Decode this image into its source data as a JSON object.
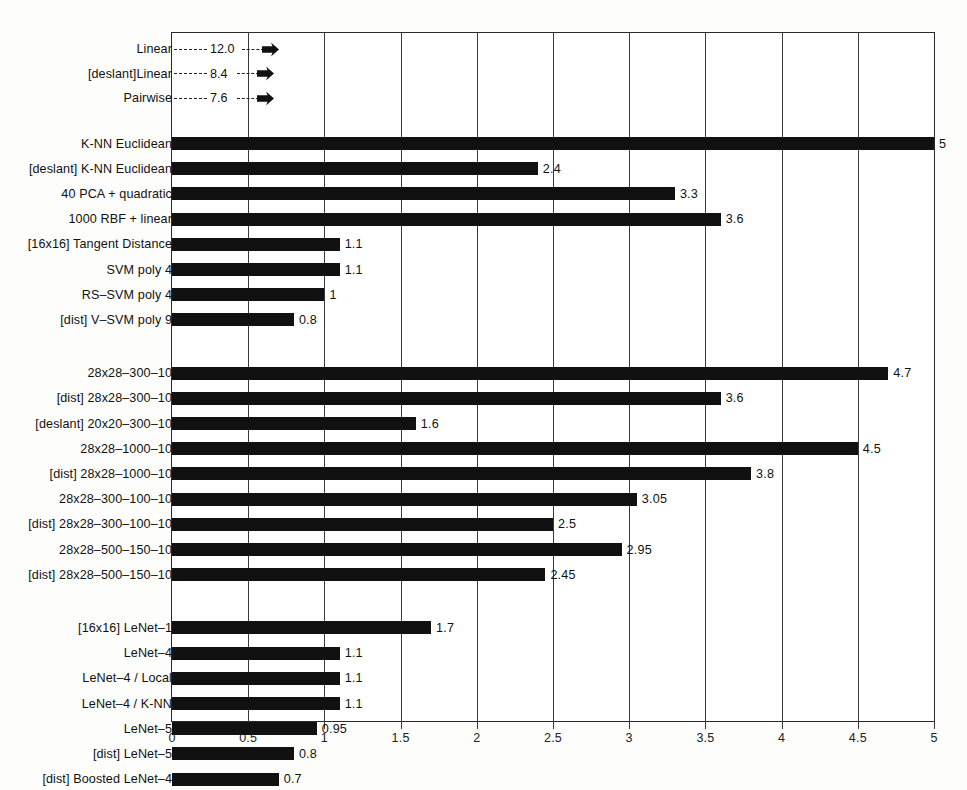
{
  "chart_data": {
    "type": "bar",
    "orientation": "horizontal",
    "title": "",
    "xlabel": "",
    "ylabel": "",
    "xlim": [
      0,
      5
    ],
    "grid": true,
    "legend": false,
    "xticks": [
      "0",
      "0.5",
      "1",
      "1.5",
      "2",
      "2.5",
      "3",
      "3.5",
      "4",
      "4.5",
      "5"
    ],
    "xtick_values": [
      0,
      0.5,
      1,
      1.5,
      2,
      2.5,
      3,
      3.5,
      4,
      4.5,
      5
    ],
    "offscale_entries": [
      {
        "label": "Linear",
        "value": 12.0,
        "value_text": "12.0",
        "marker": "arrow"
      },
      {
        "label": "[deslant]Linear",
        "value": 8.4,
        "value_text": "8.4",
        "marker": "arrow"
      },
      {
        "label": "Pairwise",
        "value": 7.6,
        "value_text": "7.6",
        "marker": "arrow"
      }
    ],
    "groups": [
      {
        "name": "classical-classifiers",
        "categories": [
          "K-NN Euclidean",
          "[deslant] K-NN Euclidean",
          "40 PCA + quadratic",
          "1000 RBF + linear",
          "[16x16] Tangent Distance",
          "SVM poly 4",
          "RS–SVM poly 4",
          "[dist] V–SVM poly 9"
        ],
        "values": [
          5.0,
          2.4,
          3.3,
          3.6,
          1.1,
          1.1,
          1.0,
          0.8
        ],
        "value_texts": [
          "5",
          "2.4",
          "3.3",
          "3.6",
          "1.1",
          "1.1",
          "1",
          "0.8"
        ]
      },
      {
        "name": "fully-connected-nets",
        "categories": [
          "28x28–300–10",
          "[dist] 28x28–300–10",
          "[deslant] 20x20–300–10",
          "28x28–1000–10",
          "[dist] 28x28–1000–10",
          "28x28–300–100–10",
          "[dist] 28x28–300–100–10",
          "28x28–500–150–10",
          "[dist] 28x28–500–150–10"
        ],
        "values": [
          4.7,
          3.6,
          1.6,
          4.5,
          3.8,
          3.05,
          2.5,
          2.95,
          2.45
        ],
        "value_texts": [
          "4.7",
          "3.6",
          "1.6",
          "4.5",
          "3.8",
          "3.05",
          "2.5",
          "2.95",
          "2.45"
        ]
      },
      {
        "name": "convolutional-nets",
        "categories": [
          "[16x16] LeNet–1",
          "LeNet–4",
          "LeNet–4 / Local",
          "LeNet–4 / K-NN",
          "LeNet–5",
          "[dist] LeNet–5",
          "[dist] Boosted LeNet–4"
        ],
        "values": [
          1.7,
          1.1,
          1.1,
          1.1,
          0.95,
          0.8,
          0.7
        ],
        "value_texts": [
          "1.7",
          "1.1",
          "1.1",
          "1.1",
          "0.95",
          "0.8",
          "0.7"
        ]
      }
    ]
  },
  "colors": {
    "bar": "#111111",
    "axis": "#2a2a2a",
    "grid": "#3a3a3a",
    "text": "#111111",
    "background": "#fdfdfc",
    "plot_background": "#ffffff"
  }
}
